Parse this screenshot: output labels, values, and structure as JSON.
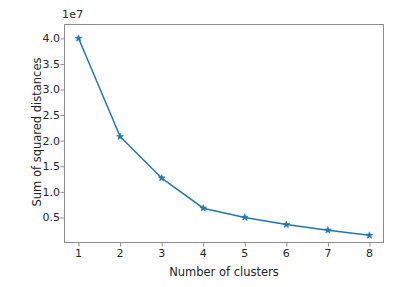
{
  "chart_data": {
    "type": "line",
    "title": "",
    "xlabel": "Number of clusters",
    "ylabel": "Sum of squared distances",
    "offset_text": "1e7",
    "x": [
      1,
      2,
      3,
      4,
      5,
      6,
      7,
      8
    ],
    "values": [
      40000000,
      20800000,
      12700000,
      6800000,
      5000000,
      3600000,
      2500000,
      1500000
    ],
    "series": [
      {
        "name": "Sum of squared distances",
        "values": [
          40000000,
          20800000,
          12700000,
          6800000,
          5000000,
          3600000,
          2500000,
          1500000
        ]
      }
    ],
    "xlim": [
      0.65,
      8.35
    ],
    "ylim": [
      0,
      42800000
    ],
    "xticks": [
      1,
      2,
      3,
      4,
      5,
      6,
      7,
      8
    ],
    "xtick_labels": [
      "1",
      "2",
      "3",
      "4",
      "5",
      "6",
      "7",
      "8"
    ],
    "yticks": [
      5000000,
      10000000,
      15000000,
      20000000,
      25000000,
      30000000,
      35000000,
      40000000
    ],
    "ytick_labels": [
      "0.5",
      "1.0",
      "1.5",
      "2.0",
      "2.5",
      "3.0",
      "3.5",
      "4.0"
    ],
    "grid": false,
    "legend": "none",
    "marker": "star",
    "line_color": "#1f77b4",
    "marker_color": "#1f77b4",
    "background_color": "#ffffff",
    "axes_color": "#8c8c8c",
    "text_color": "#262626"
  }
}
